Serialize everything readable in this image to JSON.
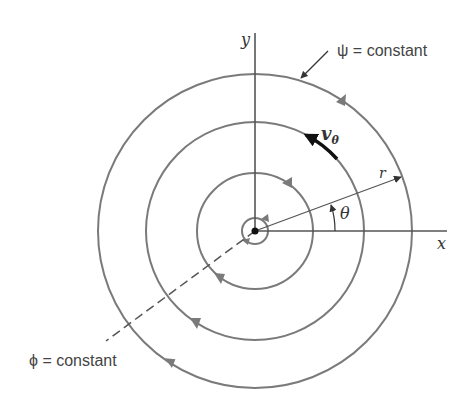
{
  "diagram": {
    "axes": {
      "x_label": "x",
      "y_label": "y"
    },
    "labels": {
      "psi": "ψ = constant",
      "phi": "ϕ = constant",
      "velocity": "v",
      "velocity_sub": "θ",
      "radius": "r",
      "angle": "θ"
    },
    "circles": [
      {
        "name": "inner-core",
        "radius": 13
      },
      {
        "name": "streamline-1",
        "radius": 58
      },
      {
        "name": "streamline-2",
        "radius": 109
      },
      {
        "name": "streamline-3",
        "radius": 157
      }
    ],
    "flow_direction": "counterclockwise",
    "colors": {
      "streamline": "#7a7a7a",
      "axis": "#555555",
      "arrow": "#111111"
    }
  }
}
